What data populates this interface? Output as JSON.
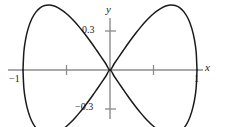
{
  "figure": {
    "background_color": "#ffffff",
    "axis_color": "#8c8c8c",
    "curve_color": "#1a1a1a",
    "width": 227,
    "height": 127
  },
  "labels": {
    "y_axis": "y",
    "x_axis": "x",
    "y_top_tick": "0.3",
    "y_bottom_tick": "−0.3",
    "x_left_tick": "−1",
    "x_right_tick": "1"
  },
  "chart_data": {
    "type": "line",
    "title": "",
    "xlabel": "x",
    "ylabel": "y",
    "xlim": [
      -1.2,
      1.35
    ],
    "ylim": [
      -0.45,
      0.45
    ],
    "grid": false,
    "legend": null,
    "x_ticks": [
      -1,
      -0.5,
      0.5,
      1
    ],
    "x_tick_labels": [
      "−1",
      "",
      "",
      "1"
    ],
    "y_ticks": [
      -0.3,
      0.3
    ],
    "y_tick_labels": [
      "−0.3",
      "0.3"
    ],
    "series": [
      {
        "name": "upper-branch",
        "x": [
          -1.0,
          -0.99,
          -0.97,
          -0.94,
          -0.9,
          -0.85,
          -0.8,
          -0.75,
          -0.7,
          -0.65,
          -0.6,
          -0.55,
          -0.5,
          -0.45,
          -0.4,
          -0.35,
          -0.3,
          -0.25,
          -0.2,
          -0.15,
          -0.1,
          -0.05,
          0.0,
          0.05,
          0.1,
          0.15,
          0.2,
          0.25,
          0.3,
          0.35,
          0.4,
          0.45,
          0.5,
          0.55,
          0.6,
          0.65,
          0.7,
          0.75,
          0.8,
          0.85,
          0.9,
          0.94,
          0.97,
          0.99,
          1.0
        ],
        "y": [
          0.0,
          0.14,
          0.236,
          0.32,
          0.392,
          0.447,
          0.48,
          0.496,
          0.5,
          0.494,
          0.48,
          0.459,
          0.433,
          0.402,
          0.367,
          0.328,
          0.286,
          0.242,
          0.196,
          0.148,
          0.0995,
          0.05,
          0.0,
          0.05,
          0.0995,
          0.148,
          0.196,
          0.242,
          0.286,
          0.328,
          0.367,
          0.402,
          0.433,
          0.459,
          0.48,
          0.494,
          0.5,
          0.496,
          0.48,
          0.447,
          0.392,
          0.32,
          0.236,
          0.14,
          0.0
        ]
      },
      {
        "name": "lower-branch",
        "x": [
          -1.0,
          -0.99,
          -0.97,
          -0.94,
          -0.9,
          -0.85,
          -0.8,
          -0.75,
          -0.7,
          -0.65,
          -0.6,
          -0.55,
          -0.5,
          -0.45,
          -0.4,
          -0.35,
          -0.3,
          -0.25,
          -0.2,
          -0.15,
          -0.1,
          -0.05,
          0.0,
          0.05,
          0.1,
          0.15,
          0.2,
          0.25,
          0.3,
          0.35,
          0.4,
          0.45,
          0.5,
          0.55,
          0.6,
          0.65,
          0.7,
          0.75,
          0.8,
          0.85,
          0.9,
          0.94,
          0.97,
          0.99,
          1.0
        ],
        "y": [
          0.0,
          -0.14,
          -0.236,
          -0.32,
          -0.392,
          -0.447,
          -0.48,
          -0.496,
          -0.5,
          -0.494,
          -0.48,
          -0.459,
          -0.433,
          -0.402,
          -0.367,
          -0.328,
          -0.286,
          -0.242,
          -0.196,
          -0.148,
          -0.0995,
          -0.05,
          0.0,
          -0.05,
          -0.0995,
          -0.148,
          -0.196,
          -0.242,
          -0.286,
          -0.328,
          -0.367,
          -0.402,
          -0.433,
          -0.459,
          -0.48,
          -0.494,
          -0.5,
          -0.496,
          -0.48,
          -0.447,
          -0.392,
          -0.32,
          -0.236,
          -0.14,
          0.0
        ]
      }
    ]
  },
  "geometry": {
    "origin_px": [
      110,
      70
    ],
    "x_unit_px": 87,
    "y_unit_px": 130
  }
}
